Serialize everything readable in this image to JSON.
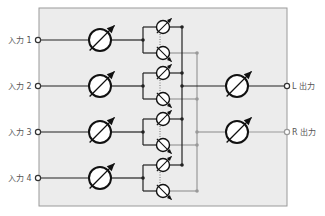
{
  "diagram": {
    "type": "mixer-block-diagram",
    "inputs": [
      {
        "label": "入力 1"
      },
      {
        "label": "入力 2"
      },
      {
        "label": "入力 3"
      },
      {
        "label": "入力 4"
      }
    ],
    "outputs": [
      {
        "label": "L 出力",
        "bus": "L"
      },
      {
        "label": "R 出力",
        "bus": "R"
      }
    ],
    "components": {
      "input_volume": "variable-resistor",
      "pan": "ganged-variable-resistor-pair",
      "output_volume": "variable-resistor"
    },
    "colors": {
      "panel_bg": "#ececec",
      "panel_border": "#9a9a9a",
      "L_bus": "#222222",
      "R_bus": "#999999"
    }
  }
}
